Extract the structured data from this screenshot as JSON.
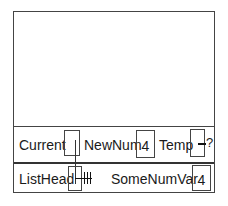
{
  "diagram": {
    "type": "variable-memory-diagram",
    "row1": {
      "variables": [
        {
          "name": "Current",
          "value": "",
          "kind": "pointer",
          "points_to": "ListHead"
        },
        {
          "name": "NewNum",
          "value": "4",
          "kind": "integer"
        },
        {
          "name": "Temp",
          "value": "",
          "kind": "pointer",
          "status": "undefined",
          "suffix": "?"
        }
      ]
    },
    "row2": {
      "variables": [
        {
          "name": "ListHead",
          "value": "",
          "kind": "pointer",
          "status": "nil",
          "nil_symbol": "╫"
        },
        {
          "name": "SomeNumVar",
          "value": "4",
          "kind": "integer"
        }
      ]
    }
  }
}
